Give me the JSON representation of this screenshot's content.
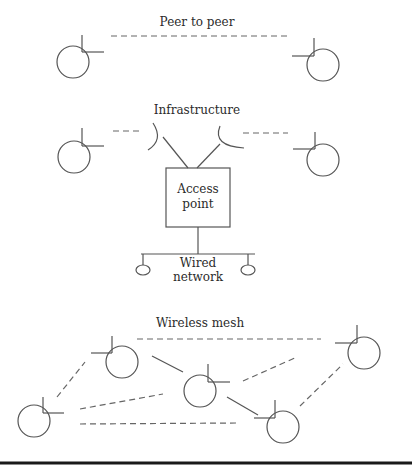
{
  "sections": {
    "peer_to_peer": {
      "title": "Peer to peer"
    },
    "infrastructure": {
      "title": "Infrastructure",
      "access_point": {
        "line1": "Access",
        "line2": "point"
      },
      "wired_network": {
        "line1": "Wired",
        "line2": "network"
      }
    },
    "wireless_mesh": {
      "title": "Wireless mesh"
    }
  },
  "colors": {
    "line": "#555555",
    "dash": "#666666",
    "rule": "#1a1a1a",
    "background": "#ffffff"
  }
}
